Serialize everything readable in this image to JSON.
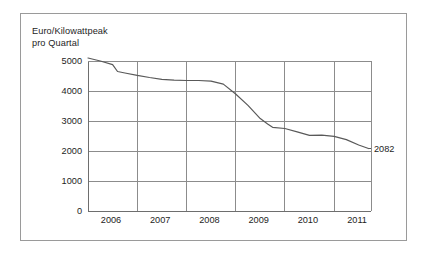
{
  "chart_data": {
    "type": "line",
    "title": "",
    "subtitle": "",
    "ylabel": "Euro/Kilowattpeak\npro Quartal",
    "xlabel": "",
    "xlim": [
      2006.0,
      2011.75
    ],
    "ylim": [
      0,
      5000
    ],
    "grid": true,
    "legend_position": "none",
    "xticks": [
      "2006",
      "2007",
      "2008",
      "2009",
      "2010",
      "2011"
    ],
    "xtick_values": [
      2006,
      2007,
      2008,
      2009,
      2010,
      2011
    ],
    "yticks": [
      "0",
      "1000",
      "2000",
      "3000",
      "4000",
      "5000"
    ],
    "ytick_values": [
      0,
      1000,
      2000,
      3000,
      4000,
      5000
    ],
    "series": [
      {
        "name": "Euro/Kilowattpeak pro Quartal",
        "color": "#595959",
        "x": [
          2006.0,
          2006.25,
          2006.5,
          2006.6,
          2006.75,
          2007.0,
          2007.25,
          2007.5,
          2007.75,
          2008.0,
          2008.25,
          2008.5,
          2008.75,
          2009.0,
          2009.25,
          2009.5,
          2009.65,
          2009.75,
          2010.0,
          2010.25,
          2010.5,
          2010.75,
          2011.0,
          2011.25,
          2011.5,
          2011.7
        ],
        "values": [
          5100,
          5000,
          4880,
          4650,
          4600,
          4520,
          4450,
          4390,
          4360,
          4350,
          4350,
          4330,
          4230,
          3900,
          3520,
          3080,
          2900,
          2790,
          2750,
          2640,
          2520,
          2530,
          2490,
          2380,
          2200,
          2082
        ]
      }
    ],
    "annotations": [
      {
        "name": "end-value-label",
        "text": "2082",
        "x": 2011.7,
        "y": 2082
      }
    ]
  },
  "colors": {
    "line": "#595959",
    "grid": "#8c8c8c",
    "axis": "#6e6e6e",
    "frame": "#9a9a9a",
    "text": "#1d1d1d",
    "background": "#ffffff"
  }
}
